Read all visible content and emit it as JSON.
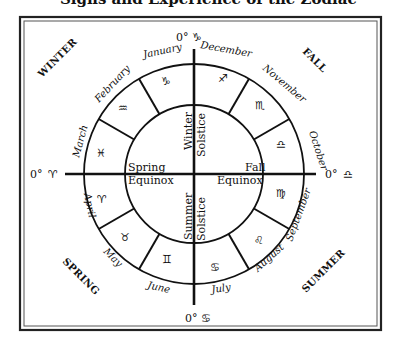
{
  "title_partial": "Signs and Experience of the Zodiac",
  "axes": {
    "top": {
      "degree": "0°",
      "sign": "♑"
    },
    "bottom": {
      "degree": "0°",
      "sign": "♋"
    },
    "left": {
      "degree": "0°",
      "sign": "♈"
    },
    "right": {
      "degree": "0°",
      "sign": "♎"
    }
  },
  "seasons": {
    "top_left": "WINTER",
    "top_right": "FALL",
    "bottom_left": "SPRING",
    "bottom_right": "SUMMER"
  },
  "events": {
    "winter_solstice": {
      "line1": "Winter",
      "line2": "Solstice"
    },
    "summer_solstice": {
      "line1": "Summer",
      "line2": "Solstice"
    },
    "spring_equinox": {
      "line1": "Spring",
      "line2": "Equinox"
    },
    "fall_equinox": {
      "line1": "Fall",
      "line2": "Equinox"
    }
  },
  "months": [
    {
      "name": "January",
      "sign": "♑",
      "sign_name": "capricorn"
    },
    {
      "name": "February",
      "sign": "♒",
      "sign_name": "aquarius"
    },
    {
      "name": "March",
      "sign": "♓",
      "sign_name": "pisces"
    },
    {
      "name": "April",
      "sign": "♈",
      "sign_name": "aries"
    },
    {
      "name": "May",
      "sign": "♉",
      "sign_name": "taurus"
    },
    {
      "name": "June",
      "sign": "♊",
      "sign_name": "gemini"
    },
    {
      "name": "July",
      "sign": "♋",
      "sign_name": "cancer"
    },
    {
      "name": "August",
      "sign": "♌",
      "sign_name": "leo"
    },
    {
      "name": "September",
      "sign": "♍",
      "sign_name": "virgo"
    },
    {
      "name": "October",
      "sign": "♎",
      "sign_name": "libra"
    },
    {
      "name": "November",
      "sign": "♏",
      "sign_name": "scorpio"
    },
    {
      "name": "December",
      "sign": "♐",
      "sign_name": "sagittarius"
    }
  ],
  "colors": {
    "ink": "#111111",
    "background": "#ffffff",
    "frame": "#333333"
  }
}
